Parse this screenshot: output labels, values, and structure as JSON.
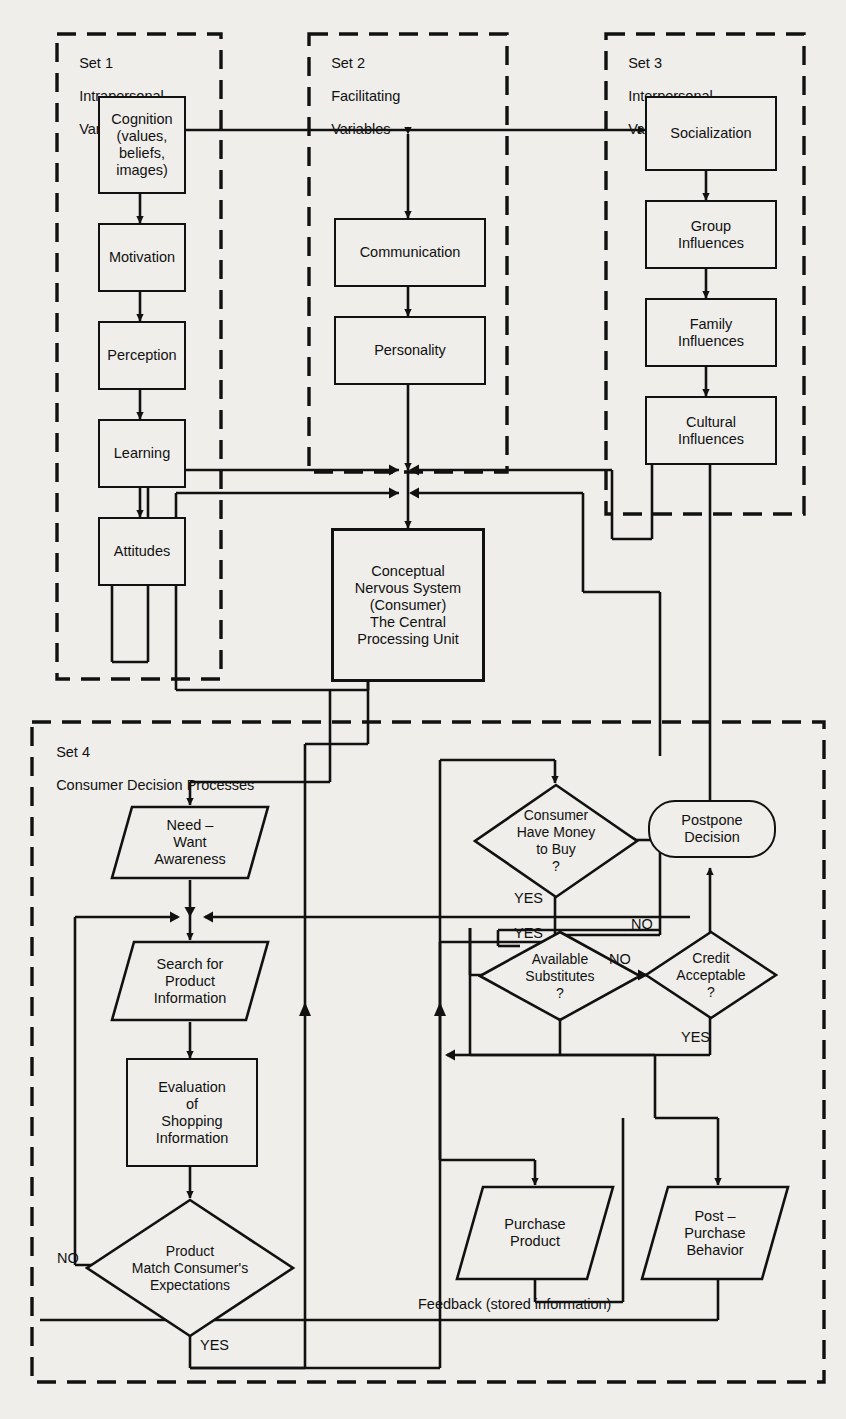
{
  "diagram": {
    "background_color": "#efeeea",
    "line_color": "#111111"
  },
  "sets": [
    {
      "id": "set1",
      "number": "Set 1",
      "name_line1": "Intrapersonal",
      "name_line2": "Variables"
    },
    {
      "id": "set2",
      "number": "Set 2",
      "name_line1": "Facilitating",
      "name_line2": "Variables"
    },
    {
      "id": "set3",
      "number": "Set 3",
      "name_line1": "Interpersonal",
      "name_line2": "Variables"
    },
    {
      "id": "set4",
      "number": "Set 4",
      "name_line1": "Consumer Decision Processes",
      "name_line2": ""
    }
  ],
  "set1_nodes": [
    {
      "id": "cognition",
      "label": "Cognition\n(values,\nbeliefs,\nimages)"
    },
    {
      "id": "motivation",
      "label": "Motivation"
    },
    {
      "id": "perception",
      "label": "Perception"
    },
    {
      "id": "learning",
      "label": "Learning"
    },
    {
      "id": "attitudes",
      "label": "Attitudes"
    }
  ],
  "set2_nodes": [
    {
      "id": "communication",
      "label": "Communication"
    },
    {
      "id": "personality",
      "label": "Personality"
    }
  ],
  "set3_nodes": [
    {
      "id": "socialization",
      "label": "Socialization"
    },
    {
      "id": "group-influences",
      "label": "Group\nInfluences"
    },
    {
      "id": "family-influences",
      "label": "Family\nInfluences"
    },
    {
      "id": "cultural-influences",
      "label": "Cultural\nInfluences"
    }
  ],
  "cpu": {
    "id": "cpu",
    "label": "Conceptual\nNervous System\n(Consumer)\nThe Central\nProcessing Unit"
  },
  "set4_nodes": [
    {
      "id": "need-want-awareness",
      "shape": "parallelogram",
      "label": "Need –\nWant\nAwareness"
    },
    {
      "id": "search-for-product-information",
      "shape": "parallelogram",
      "label": "Search for\nProduct\nInformation"
    },
    {
      "id": "evaluation-of-shopping-information",
      "shape": "rect",
      "label": "Evaluation\nof\nShopping\nInformation"
    },
    {
      "id": "product-match-expectations",
      "shape": "diamond",
      "label": "Product\nMatch Consumer's\nExpectations"
    },
    {
      "id": "consumer-have-money",
      "shape": "diamond",
      "label": "Consumer\nHave Money\nto Buy\n?"
    },
    {
      "id": "available-substitutes",
      "shape": "diamond",
      "label": "Available\nSubstitutes\n?"
    },
    {
      "id": "credit-acceptable",
      "shape": "diamond",
      "label": "Credit\nAcceptable\n?"
    },
    {
      "id": "postpone-decision",
      "shape": "stadium",
      "label": "Postpone\nDecision"
    },
    {
      "id": "purchase-product",
      "shape": "parallelogram",
      "label": "Purchase\nProduct"
    },
    {
      "id": "post-purchase-behavior",
      "shape": "parallelogram",
      "label": "Post –\nPurchase\nBehavior"
    }
  ],
  "edge_labels": {
    "money_yes": "YES",
    "money_no": "NO",
    "substitutes_yes": "YES",
    "substitutes_no": "NO",
    "credit_no": "NO",
    "credit_yes": "YES",
    "match_no": "NO",
    "match_yes": "YES"
  },
  "feedback_label": "Feedback (stored information)"
}
